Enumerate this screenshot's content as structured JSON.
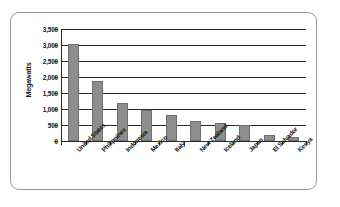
{
  "chart_data": {
    "type": "bar",
    "title": "",
    "subtitle": "",
    "xlabel": "",
    "ylabel": "Megawatts",
    "categories": [
      "United States",
      "Philippines",
      "Indonesia",
      "Mexico",
      "Italy",
      "New Zealand",
      "Iceland",
      "Japan",
      "El Salvador",
      "Kenya"
    ],
    "values": [
      3030,
      1890,
      1200,
      960,
      810,
      620,
      570,
      500,
      200,
      130
    ],
    "ylim": [
      0,
      3500
    ],
    "ytick_values": [
      0,
      500,
      1000,
      1500,
      2000,
      2500,
      3000,
      3500
    ],
    "ytick_labels": [
      "0",
      "500",
      "1,000",
      "1,500",
      "2,000",
      "2,500",
      "3,000",
      "3,500"
    ],
    "grid": true,
    "grid_axis": "y",
    "legend": false,
    "legend_position": "none",
    "bar_color": "#8d8d8d",
    "axis_color": "#2b2b2b",
    "frame_color": "#9a9a9a",
    "background_color": "#ffffff",
    "text_color": "#141414"
  }
}
